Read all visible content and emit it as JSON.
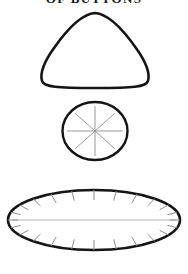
{
  "plate": {
    "title": "OF BUTTONS",
    "title_clipped": true,
    "background_color": "#ffffff",
    "ink_color": "#141414",
    "detail_color": "#8d8d8d",
    "width": 188,
    "height": 274
  },
  "figures": [
    {
      "index": 1,
      "name": "rounded-triangle-button",
      "shape": "rounded triangle outline",
      "filled": false,
      "stroke_color": "#141414",
      "stroke_width": 2.6,
      "bounds": {
        "x": 40,
        "y": 12,
        "width": 110,
        "height": 76
      },
      "detail_lines": 0
    },
    {
      "index": 2,
      "name": "spoked-circle-button",
      "shape": "circle outline with radial spokes",
      "filled": false,
      "stroke_color": "#141414",
      "stroke_width": 2.4,
      "bounds": {
        "x": 62,
        "y": 102,
        "width": 66,
        "height": 58
      },
      "detail_lines": 8,
      "detail_color": "#8d8d8d"
    },
    {
      "index": 3,
      "name": "ticked-ellipse-button",
      "shape": "wide ellipse outline with inward tick marks and center line",
      "filled": false,
      "stroke_color": "#141414",
      "stroke_width": 2.6,
      "bounds": {
        "x": 8,
        "y": 190,
        "width": 172,
        "height": 60
      },
      "detail_lines": 24,
      "detail_color": "#8d8d8d",
      "has_center_line": true
    }
  ]
}
